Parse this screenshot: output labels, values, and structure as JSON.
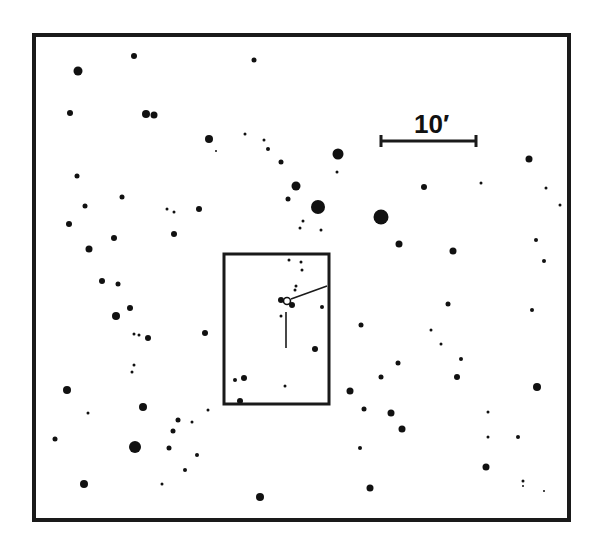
{
  "chart": {
    "frame": {
      "x": 34,
      "y": 35,
      "w": 240,
      "h": 212
    },
    "scale_bar": {
      "label": "10′",
      "x1": 381,
      "x2": 476,
      "y": 141,
      "label_x": 414,
      "label_y": 133
    },
    "inset_box": {
      "x": 224,
      "y": 254,
      "w": 105,
      "h": 150
    },
    "target": {
      "x": 287,
      "y": 301,
      "r": 3.5
    },
    "pointer_diag": {
      "x1": 291,
      "y1": 299,
      "x2": 327,
      "y2": 286
    },
    "pointer_vert": {
      "x1": 286,
      "y1": 312,
      "x2": 286,
      "y2": 348
    },
    "stars": [
      [
        78,
        71,
        4.5
      ],
      [
        134,
        56,
        3
      ],
      [
        254,
        60,
        2.5
      ],
      [
        70,
        113,
        3
      ],
      [
        146,
        114,
        4
      ],
      [
        154,
        115,
        3.5
      ],
      [
        209,
        139,
        4
      ],
      [
        216,
        151,
        1
      ],
      [
        245,
        134,
        1.5
      ],
      [
        264,
        140,
        1.5
      ],
      [
        268,
        149,
        2
      ],
      [
        281,
        162,
        2.5
      ],
      [
        338,
        154,
        5.5
      ],
      [
        337,
        172,
        1.5
      ],
      [
        77,
        176,
        2.5
      ],
      [
        122,
        197,
        2.5
      ],
      [
        85,
        206,
        2.5
      ],
      [
        167,
        209,
        1.5
      ],
      [
        174,
        212,
        1.5
      ],
      [
        199,
        209,
        3
      ],
      [
        296,
        186,
        4.5
      ],
      [
        288,
        199,
        2.5
      ],
      [
        318,
        207,
        7
      ],
      [
        381,
        217,
        7.5
      ],
      [
        303,
        221,
        1.5
      ],
      [
        321,
        230,
        1.5
      ],
      [
        69,
        224,
        3
      ],
      [
        114,
        238,
        3
      ],
      [
        89,
        249,
        3.5
      ],
      [
        174,
        234,
        3
      ],
      [
        399,
        244,
        3.5
      ],
      [
        453,
        251,
        3.5
      ],
      [
        424,
        187,
        3
      ],
      [
        481,
        183,
        1.5
      ],
      [
        529,
        159,
        3.5
      ],
      [
        546,
        188,
        1.5
      ],
      [
        536,
        240,
        2
      ],
      [
        544,
        261,
        2
      ],
      [
        102,
        281,
        3
      ],
      [
        118,
        284,
        2.5
      ],
      [
        130,
        308,
        3
      ],
      [
        116,
        316,
        4
      ],
      [
        134,
        334,
        1.5
      ],
      [
        139,
        335,
        1.5
      ],
      [
        148,
        338,
        3
      ],
      [
        205,
        333,
        3
      ],
      [
        134,
        365,
        1.5
      ],
      [
        132,
        372,
        1.5
      ],
      [
        67,
        390,
        4
      ],
      [
        88,
        413,
        1.5
      ],
      [
        143,
        407,
        4
      ],
      [
        208,
        410,
        1.5
      ],
      [
        178,
        420,
        2.5
      ],
      [
        173,
        431,
        2.5
      ],
      [
        192,
        422,
        1.5
      ],
      [
        169,
        448,
        2.5
      ],
      [
        135,
        447,
        6
      ],
      [
        197,
        455,
        2
      ],
      [
        185,
        470,
        2
      ],
      [
        162,
        484,
        1.5
      ],
      [
        55,
        439,
        2.5
      ],
      [
        84,
        484,
        4
      ],
      [
        260,
        497,
        4
      ],
      [
        300,
        228,
        1.5
      ],
      [
        289,
        260,
        1.5
      ],
      [
        301,
        262,
        1.5
      ],
      [
        302,
        270,
        1.5
      ],
      [
        296,
        286,
        1.5
      ],
      [
        295,
        290,
        1.5
      ],
      [
        281,
        300,
        3
      ],
      [
        292,
        305,
        3
      ],
      [
        281,
        316,
        1.5
      ],
      [
        322,
        307,
        2
      ],
      [
        315,
        349,
        3
      ],
      [
        244,
        378,
        3
      ],
      [
        235,
        380,
        2
      ],
      [
        285,
        386,
        1.5
      ],
      [
        240,
        401,
        3
      ],
      [
        361,
        325,
        2.5
      ],
      [
        448,
        304,
        2.5
      ],
      [
        431,
        330,
        1.5
      ],
      [
        441,
        344,
        1.5
      ],
      [
        461,
        359,
        2
      ],
      [
        457,
        377,
        3
      ],
      [
        381,
        377,
        2.5
      ],
      [
        398,
        363,
        2.5
      ],
      [
        350,
        391,
        3.5
      ],
      [
        364,
        409,
        2.5
      ],
      [
        391,
        413,
        3.5
      ],
      [
        402,
        429,
        3.5
      ],
      [
        360,
        448,
        2
      ],
      [
        370,
        488,
        3.5
      ],
      [
        488,
        412,
        1.5
      ],
      [
        488,
        437,
        1.5
      ],
      [
        518,
        437,
        2
      ],
      [
        486,
        467,
        3.5
      ],
      [
        532,
        310,
        2
      ],
      [
        537,
        387,
        4
      ],
      [
        523,
        481,
        1.5
      ],
      [
        523,
        486,
        1
      ],
      [
        544,
        491,
        1
      ],
      [
        560,
        205,
        1.5
      ]
    ]
  }
}
